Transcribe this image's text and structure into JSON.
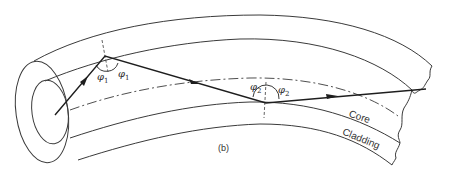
{
  "figure": {
    "caption": "(b)"
  },
  "labels": {
    "core": "Core",
    "cladding": "Cladding",
    "phi1_left": "φ",
    "phi1_left_sub": "1",
    "phi1_right": "φ",
    "phi1_right_sub": "1",
    "phi2_left": "φ",
    "phi2_left_sub": "2",
    "phi2_right": "φ",
    "phi2_right_sub": "2"
  },
  "colors": {
    "line": "#3a3a3a",
    "ray": "#1e1e1e",
    "background": "#ffffff"
  }
}
